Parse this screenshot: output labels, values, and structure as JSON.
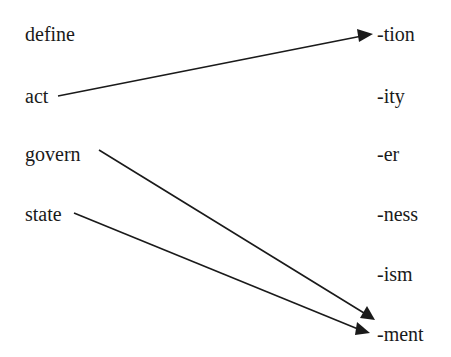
{
  "diagram": {
    "type": "word-suffix matching",
    "roots": [
      {
        "label": "define",
        "x": 25,
        "y": 24
      },
      {
        "label": "act",
        "x": 25,
        "y": 86
      },
      {
        "label": "govern",
        "x": 25,
        "y": 144
      },
      {
        "label": "state",
        "x": 25,
        "y": 204
      }
    ],
    "suffixes": [
      {
        "label": "-tion",
        "x": 377,
        "y": 24
      },
      {
        "label": "-ity",
        "x": 377,
        "y": 86
      },
      {
        "label": "-er",
        "x": 377,
        "y": 144
      },
      {
        "label": "-ness",
        "x": 377,
        "y": 204
      },
      {
        "label": "-ism",
        "x": 377,
        "y": 264
      },
      {
        "label": "-ment",
        "x": 377,
        "y": 324
      }
    ],
    "connections": [
      {
        "from": "act",
        "to": "-tion"
      },
      {
        "from": "govern",
        "to": "-ment"
      },
      {
        "from": "state",
        "to": "-ment"
      }
    ],
    "line_color": "#1a1a1a"
  }
}
